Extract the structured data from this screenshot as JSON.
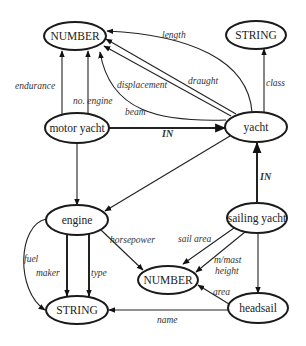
{
  "nodes": {
    "number_top": {
      "label": "NUMBER",
      "cx": 75,
      "cy": 36,
      "rx": 31,
      "ry": 14
    },
    "string_top": {
      "label": "STRING",
      "cx": 256,
      "cy": 35,
      "rx": 30,
      "ry": 14
    },
    "motor_yacht": {
      "label": "motor yacht",
      "cx": 77,
      "cy": 128,
      "rx": 32,
      "ry": 15
    },
    "yacht": {
      "label": "yacht",
      "cx": 256,
      "cy": 127,
      "rx": 31,
      "ry": 15
    },
    "engine": {
      "label": "engine",
      "cx": 77,
      "cy": 220,
      "rx": 31,
      "ry": 15
    },
    "sailing_yacht": {
      "label": "sailing yacht",
      "cx": 257,
      "cy": 218,
      "rx": 30,
      "ry": 15
    },
    "number_bottom": {
      "label": "NUMBER",
      "cx": 168,
      "cy": 280,
      "rx": 30,
      "ry": 14
    },
    "string_bottom": {
      "label": "STRING",
      "cx": 77,
      "cy": 310,
      "rx": 31,
      "ry": 14
    },
    "headsail": {
      "label": "headsail",
      "cx": 258,
      "cy": 308,
      "rx": 30,
      "ry": 15
    }
  },
  "edges": [
    {
      "from": "motor_yacht",
      "to": "number_top",
      "label": "endurance"
    },
    {
      "from": "motor_yacht",
      "to": "number_top",
      "label": "no. engine"
    },
    {
      "from": "yacht",
      "to": "number_top",
      "label": "length"
    },
    {
      "from": "yacht",
      "to": "number_top",
      "label": "displacement"
    },
    {
      "from": "yacht",
      "to": "number_top",
      "label": "draught"
    },
    {
      "from": "yacht",
      "to": "number_top",
      "label": "beam"
    },
    {
      "from": "yacht",
      "to": "string_top",
      "label": "class"
    },
    {
      "from": "motor_yacht",
      "to": "yacht",
      "label": "IN"
    },
    {
      "from": "sailing_yacht",
      "to": "yacht",
      "label": "IN"
    },
    {
      "from": "motor_yacht",
      "to": "engine",
      "label": ""
    },
    {
      "from": "yacht",
      "to": "engine",
      "label": ""
    },
    {
      "from": "engine",
      "to": "string_bottom",
      "label": "fuel"
    },
    {
      "from": "engine",
      "to": "string_bottom",
      "label": "maker"
    },
    {
      "from": "engine",
      "to": "string_bottom",
      "label": "type"
    },
    {
      "from": "engine",
      "to": "number_bottom",
      "label": "horsepower"
    },
    {
      "from": "sailing_yacht",
      "to": "number_bottom",
      "label": "sail area"
    },
    {
      "from": "sailing_yacht",
      "to": "number_bottom",
      "label": "m/mast height"
    },
    {
      "from": "sailing_yacht",
      "to": "headsail",
      "label": ""
    },
    {
      "from": "headsail",
      "to": "number_bottom",
      "label": "area"
    },
    {
      "from": "headsail",
      "to": "string_bottom",
      "label": "name"
    }
  ],
  "labels": {
    "endurance": "endurance",
    "no_engine": "no. engine",
    "length": "length",
    "displacement": "displacement",
    "draught": "draught",
    "beam": "beam",
    "class": "class",
    "in_motor": "IN",
    "in_sailing": "IN",
    "fuel": "fuel",
    "maker": "maker",
    "type": "type",
    "horsepower": "horsepower",
    "sail_area": "sail area",
    "mmast_1": "m/mast",
    "mmast_2": "height",
    "area": "area",
    "name": "name"
  }
}
